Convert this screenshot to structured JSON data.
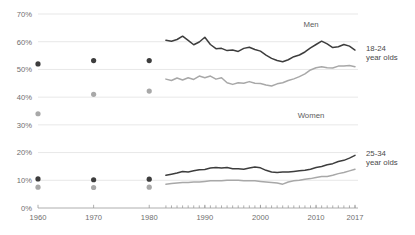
{
  "chart_data": {
    "type": "line",
    "title": "",
    "subtitle": "",
    "xlabel": "",
    "ylabel": "",
    "xlim": [
      1958,
      2018
    ],
    "ylim": [
      0,
      72
    ],
    "grid": true,
    "legend_position": "inline-annotations",
    "y_ticks": [
      {
        "label": "0%",
        "value": 0
      },
      {
        "label": "10%",
        "value": 10
      },
      {
        "label": "20%",
        "value": 20
      },
      {
        "label": "30%",
        "value": 30
      },
      {
        "label": "40%",
        "value": 40
      },
      {
        "label": "50%",
        "value": 50
      },
      {
        "label": "60%",
        "value": 60
      },
      {
        "label": "70%",
        "value": 70
      }
    ],
    "x_ticks": [
      {
        "label": "1960",
        "value": 1960
      },
      {
        "label": "1970",
        "value": 1970
      },
      {
        "label": "1980",
        "value": 1980
      },
      {
        "label": "1990",
        "value": 1990
      },
      {
        "label": "2000",
        "value": 2000
      },
      {
        "label": "2010",
        "value": 2010
      },
      {
        "label": "2017",
        "value": 2017
      }
    ],
    "minor_x_ticks_start": 1983,
    "minor_x_ticks_end": 2017,
    "colors": {
      "men": "#3d3d3d",
      "women": "#a8a8a8",
      "grid": "#dcdcdc",
      "axis": "#9a9a9a",
      "text": "#6e6e6e"
    },
    "panels": [
      {
        "name": "18-24 year olds",
        "label_line1": "18-24",
        "label_line2": "year olds",
        "series": [
          {
            "name": "Men",
            "label": "Men",
            "color": "#3d3d3d",
            "markers": [
              {
                "x": 1960,
                "y": 52.0
              },
              {
                "x": 1970,
                "y": 53.2
              },
              {
                "x": 1980,
                "y": 53.2
              }
            ],
            "x": [
              1983,
              1984,
              1985,
              1986,
              1987,
              1988,
              1989,
              1990,
              1991,
              1992,
              1993,
              1994,
              1995,
              1996,
              1997,
              1998,
              1999,
              2000,
              2001,
              2002,
              2003,
              2004,
              2005,
              2006,
              2007,
              2008,
              2009,
              2010,
              2011,
              2012,
              2013,
              2014,
              2015,
              2016,
              2017
            ],
            "values": [
              60.5,
              60.2,
              60.8,
              62.0,
              60.5,
              58.9,
              59.9,
              61.6,
              59.0,
              57.5,
              57.6,
              56.8,
              57.0,
              56.5,
              57.6,
              58.0,
              57.2,
              56.6,
              55.2,
              54.0,
              53.2,
              52.8,
              53.5,
              54.6,
              55.2,
              56.3,
              57.8,
              59.0,
              60.2,
              59.2,
              57.9,
              58.2,
              59.0,
              58.4,
              57.0
            ]
          },
          {
            "name": "Women",
            "label": "Women",
            "color": "#a8a8a8",
            "markers": [
              {
                "x": 1960,
                "y": 34.0
              },
              {
                "x": 1970,
                "y": 41.0
              },
              {
                "x": 1980,
                "y": 42.2
              }
            ],
            "x": [
              1983,
              1984,
              1985,
              1986,
              1987,
              1988,
              1989,
              1990,
              1991,
              1992,
              1993,
              1994,
              1995,
              1996,
              1997,
              1998,
              1999,
              2000,
              2001,
              2002,
              2003,
              2004,
              2005,
              2006,
              2007,
              2008,
              2009,
              2010,
              2011,
              2012,
              2013,
              2014,
              2015,
              2016,
              2017
            ],
            "values": [
              46.5,
              46.0,
              46.9,
              46.2,
              47.0,
              46.4,
              47.6,
              47.0,
              47.6,
              46.5,
              47.0,
              45.2,
              44.6,
              45.2,
              45.0,
              45.6,
              45.0,
              44.9,
              44.4,
              44.0,
              44.8,
              45.2,
              46.0,
              46.6,
              47.4,
              48.4,
              49.8,
              50.6,
              51.0,
              50.6,
              50.5,
              51.2,
              51.2,
              51.4,
              51.0
            ]
          }
        ]
      },
      {
        "name": "25-34 year olds",
        "label_line1": "25-34",
        "label_line2": "year olds",
        "series": [
          {
            "name": "Men",
            "label": "",
            "color": "#3d3d3d",
            "markers": [
              {
                "x": 1960,
                "y": 10.5
              },
              {
                "x": 1970,
                "y": 10.2
              },
              {
                "x": 1980,
                "y": 10.4
              }
            ],
            "x": [
              1983,
              1984,
              1985,
              1986,
              1987,
              1988,
              1989,
              1990,
              1991,
              1992,
              1993,
              1994,
              1995,
              1996,
              1997,
              1998,
              1999,
              2000,
              2001,
              2002,
              2003,
              2004,
              2005,
              2006,
              2007,
              2008,
              2009,
              2010,
              2011,
              2012,
              2013,
              2014,
              2015,
              2016,
              2017
            ],
            "values": [
              11.8,
              12.2,
              12.6,
              13.2,
              13.0,
              13.4,
              13.8,
              13.9,
              14.4,
              14.6,
              14.4,
              14.6,
              14.2,
              14.2,
              14.0,
              14.4,
              14.8,
              14.5,
              13.6,
              13.0,
              12.8,
              13.0,
              13.0,
              13.2,
              13.4,
              13.6,
              14.0,
              14.6,
              15.0,
              15.6,
              16.0,
              16.8,
              17.2,
              18.0,
              19.0
            ]
          },
          {
            "name": "Women",
            "label": "",
            "color": "#a8a8a8",
            "markers": [
              {
                "x": 1960,
                "y": 7.5
              },
              {
                "x": 1970,
                "y": 7.4
              },
              {
                "x": 1980,
                "y": 7.5
              }
            ],
            "x": [
              1983,
              1984,
              1985,
              1986,
              1987,
              1988,
              1989,
              1990,
              1991,
              1992,
              1993,
              1994,
              1995,
              1996,
              1997,
              1998,
              1999,
              2000,
              2001,
              2002,
              2003,
              2004,
              2005,
              2006,
              2007,
              2008,
              2009,
              2010,
              2011,
              2012,
              2013,
              2014,
              2015,
              2016,
              2017
            ],
            "values": [
              8.6,
              8.8,
              9.0,
              9.2,
              9.2,
              9.4,
              9.4,
              9.6,
              9.8,
              9.8,
              9.8,
              10.0,
              10.0,
              10.0,
              9.8,
              9.8,
              9.8,
              9.6,
              9.4,
              9.2,
              9.0,
              8.6,
              9.4,
              9.8,
              10.0,
              10.4,
              10.6,
              11.0,
              11.4,
              11.4,
              11.8,
              12.4,
              12.8,
              13.4,
              14.0
            ]
          }
        ]
      }
    ]
  }
}
